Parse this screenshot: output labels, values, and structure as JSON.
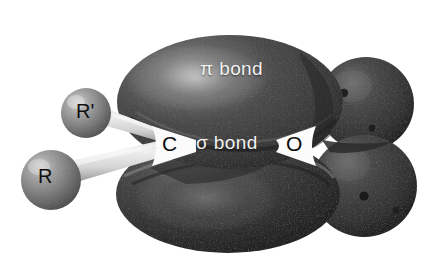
{
  "figure": {
    "background_color": "#ffffff",
    "width": 442,
    "height": 269
  },
  "labels": {
    "pi_bond": "π bond",
    "sigma_bond": "σ bond",
    "carbon_atom": "C",
    "oxygen_atom": "O",
    "r_prime_substituent": "R'",
    "r_substituent": "R"
  },
  "colors": {
    "background": "#ffffff",
    "lobe_dark": "#3c3c3c",
    "lobe_mid": "#555555",
    "lobe_highlight": "#8e8e8e",
    "lobe_shadow": "#202020",
    "sphere_gray": "#8a8a8a",
    "sphere_shadow": "#4f4f4f",
    "sphere_highlight": "#c8c8c8",
    "bond_cylinder": "#d8d8d8",
    "node_white": "#fbfbfb",
    "label_light": "#f2f2f2",
    "label_dark": "#0a0a0a"
  },
  "structures": {
    "pi_lobe_top": {
      "name": "pi-lobe-top",
      "description": "Large upper pi orbital lobe",
      "center": [
        230,
        103
      ],
      "radius_x": 112,
      "radius_y": 66
    },
    "pi_lobe_bottom": {
      "name": "pi-lobe-bottom",
      "description": "Large lower pi orbital lobe",
      "center": [
        228,
        193
      ],
      "radius_x": 110,
      "radius_y": 58
    },
    "sigma_lobe": {
      "name": "sigma-lobe",
      "description": "Sigma bonding lobe between C and O",
      "center": [
        240,
        146
      ],
      "radius_x": 58,
      "radius_y": 24
    },
    "oxygen_lone_pair_upper": {
      "name": "oxygen-lone-pair-upper",
      "center": [
        366,
        104
      ],
      "radius_x": 48,
      "radius_y": 47
    },
    "oxygen_lone_pair_lower": {
      "name": "oxygen-lone-pair-lower",
      "center": [
        364,
        186
      ],
      "radius_x": 52,
      "radius_y": 50
    },
    "r_prime_sphere": {
      "name": "r-prime-sphere",
      "center": [
        86,
        113
      ],
      "radius": 25
    },
    "r_sphere": {
      "name": "r-sphere",
      "center": [
        51,
        180
      ],
      "radius": 30
    },
    "bond_r_prime_to_c": {
      "name": "bond-r-prime-to-carbon",
      "from": [
        100,
        120
      ],
      "to": [
        175,
        142
      ]
    },
    "bond_r_to_c": {
      "name": "bond-r-to-carbon",
      "from": [
        72,
        172
      ],
      "to": [
        175,
        146
      ]
    },
    "node_carbon": {
      "name": "carbon-node-gap",
      "center": [
        172,
        145
      ]
    },
    "node_oxygen": {
      "name": "oxygen-node-gap",
      "center": [
        296,
        145
      ]
    }
  }
}
